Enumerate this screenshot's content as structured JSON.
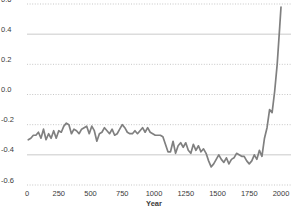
{
  "chart_data": {
    "type": "line",
    "title": "",
    "subtitle": "",
    "xlabel": "Year",
    "ylabel": "",
    "xlim": [
      0,
      2000
    ],
    "ylim": [
      -0.6,
      0.6
    ],
    "grid": true,
    "legend": null,
    "legend_position": "none",
    "series_name": "Temperature anomaly",
    "line_color": "#808080",
    "grid_color": "#b9b9b9",
    "text_color": "#3a3a3a",
    "background_color": "#ffffff",
    "y_ticks": [
      0.6,
      0.4,
      0.2,
      0.0,
      -0.2,
      -0.4,
      -0.6
    ],
    "y_tick_labels": [
      "0.6",
      "0.4",
      "0.2",
      "0.0",
      "-0.2",
      "-0.4",
      "-0.6"
    ],
    "x_ticks": [
      0,
      250,
      500,
      750,
      1000,
      1250,
      1500,
      1750,
      2000
    ],
    "x_tick_labels": [
      "0",
      "250",
      "500",
      "750",
      "1000",
      "1250",
      "1500",
      "1750",
      "2000"
    ],
    "x": [
      10,
      30,
      50,
      70,
      90,
      110,
      130,
      150,
      170,
      190,
      210,
      230,
      250,
      270,
      290,
      310,
      330,
      350,
      370,
      390,
      410,
      430,
      450,
      470,
      490,
      510,
      530,
      550,
      570,
      590,
      610,
      630,
      650,
      670,
      690,
      710,
      730,
      750,
      770,
      790,
      810,
      830,
      850,
      870,
      890,
      910,
      930,
      950,
      970,
      990,
      1010,
      1030,
      1050,
      1070,
      1090,
      1110,
      1130,
      1150,
      1170,
      1190,
      1210,
      1230,
      1250,
      1270,
      1290,
      1310,
      1330,
      1350,
      1370,
      1390,
      1410,
      1430,
      1450,
      1470,
      1490,
      1510,
      1530,
      1550,
      1570,
      1590,
      1610,
      1630,
      1650,
      1670,
      1690,
      1710,
      1730,
      1750,
      1770,
      1790,
      1810,
      1830,
      1850,
      1870,
      1890,
      1910,
      1930,
      1950,
      1970,
      1990,
      2000
    ],
    "values": [
      -0.3,
      -0.29,
      -0.27,
      -0.27,
      -0.25,
      -0.29,
      -0.23,
      -0.3,
      -0.26,
      -0.29,
      -0.24,
      -0.29,
      -0.24,
      -0.25,
      -0.21,
      -0.19,
      -0.2,
      -0.26,
      -0.23,
      -0.24,
      -0.26,
      -0.23,
      -0.22,
      -0.21,
      -0.26,
      -0.21,
      -0.24,
      -0.31,
      -0.26,
      -0.25,
      -0.22,
      -0.24,
      -0.26,
      -0.23,
      -0.27,
      -0.26,
      -0.23,
      -0.2,
      -0.22,
      -0.25,
      -0.26,
      -0.26,
      -0.24,
      -0.26,
      -0.24,
      -0.22,
      -0.25,
      -0.22,
      -0.25,
      -0.26,
      -0.27,
      -0.27,
      -0.27,
      -0.28,
      -0.33,
      -0.38,
      -0.38,
      -0.31,
      -0.39,
      -0.34,
      -0.32,
      -0.35,
      -0.32,
      -0.37,
      -0.39,
      -0.33,
      -0.37,
      -0.34,
      -0.38,
      -0.36,
      -0.39,
      -0.44,
      -0.48,
      -0.46,
      -0.43,
      -0.4,
      -0.43,
      -0.45,
      -0.42,
      -0.46,
      -0.43,
      -0.42,
      -0.39,
      -0.4,
      -0.41,
      -0.41,
      -0.44,
      -0.46,
      -0.44,
      -0.4,
      -0.43,
      -0.37,
      -0.41,
      -0.29,
      -0.22,
      -0.1,
      -0.12,
      0.02,
      0.2,
      0.45,
      0.58
    ],
    "annotations": []
  }
}
